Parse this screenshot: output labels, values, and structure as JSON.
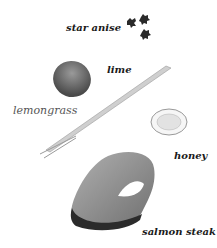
{
  "ingredients": [
    {
      "name": "star anise"
    },
    {
      "name": "lime"
    },
    {
      "name": "lemongrass"
    },
    {
      "name": "honey"
    },
    {
      "name": "salmon steak"
    }
  ],
  "labels": {
    "star_anise": "star anise",
    "lime": "lime",
    "lemongrass": "lemongrass",
    "honey": "honey",
    "salmon_steak": "salmon steak"
  },
  "colors": {
    "text": "#1a1a1a",
    "lemongrass_text": "#555555",
    "lime": "#6b6b6b",
    "salmon": "#8a8a8a",
    "skin": "#2b2b2b"
  }
}
